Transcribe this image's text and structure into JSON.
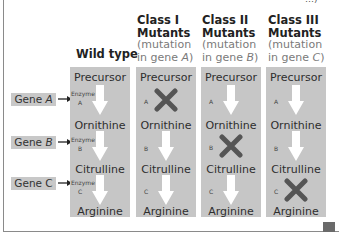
{
  "top_cut_text": "…)",
  "headers": {
    "wild_type": "Wild type",
    "classes": [
      {
        "title_1": "Class I",
        "title_2": "Mutants",
        "sub_1": "(mutation",
        "sub_2": "in gene ",
        "gene": "A",
        "close": ")"
      },
      {
        "title_1": "Class II",
        "title_2": "Mutants",
        "sub_1": "(mutation",
        "sub_2": "in gene ",
        "gene": "B",
        "close": ")"
      },
      {
        "title_1": "Class III",
        "title_2": "Mutants",
        "sub_1": "(mutation",
        "sub_2": "in gene ",
        "gene": "C",
        "close": ")"
      }
    ]
  },
  "genes": [
    {
      "prefix": "Gene ",
      "letter": "A"
    },
    {
      "prefix": "Gene ",
      "letter": "B"
    },
    {
      "prefix": "Gene ",
      "letter": "C"
    }
  ],
  "enzyme_label": "Enzyme",
  "enzymes": [
    "A",
    "B",
    "C"
  ],
  "compounds": [
    "Precursor",
    "Ornithine",
    "Citrulline",
    "Arginine"
  ],
  "columns": [
    {
      "name": "Wild type",
      "blocked_step": null
    },
    {
      "name": "Class I Mutants",
      "blocked_step": "A"
    },
    {
      "name": "Class II Mutants",
      "blocked_step": "B"
    },
    {
      "name": "Class III Mutants",
      "blocked_step": "C"
    }
  ],
  "colors": {
    "box": "#c6c6c6",
    "gene_box": "#c8c8c8",
    "x_mark": "#555555",
    "arrow": "#ffffff"
  }
}
